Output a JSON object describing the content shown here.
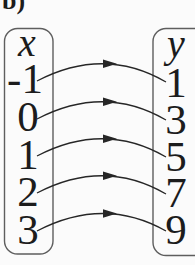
{
  "figure_label": "b)",
  "diagram": {
    "type": "function-mapping-diagram",
    "left_set": {
      "header": "x",
      "values": [
        "-1",
        "0",
        "1",
        "2",
        "3"
      ]
    },
    "right_set": {
      "header": "y",
      "values": [
        "1",
        "3",
        "5",
        "7",
        "9"
      ]
    },
    "mappings": [
      {
        "from": "-1",
        "to": "1"
      },
      {
        "from": "0",
        "to": "3"
      },
      {
        "from": "1",
        "to": "5"
      },
      {
        "from": "2",
        "to": "7"
      },
      {
        "from": "3",
        "to": "9"
      }
    ],
    "colors": {
      "border": "#5e5e5e",
      "arrow": "#262626",
      "text": "#1c1c1c",
      "background": "#fbfbfb"
    }
  }
}
